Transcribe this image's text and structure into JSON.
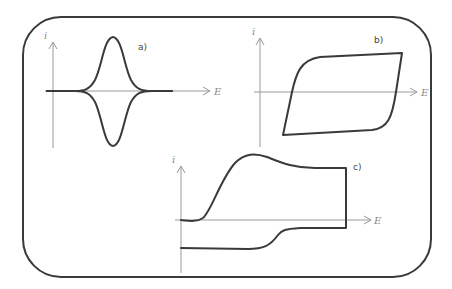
{
  "figure": {
    "colors": {
      "frame": "#3a3a3a",
      "curve": "#3a3a3a",
      "axis": "#9a9a9a",
      "axis_label": "#8a8a8a",
      "background": "#ffffff"
    },
    "panels": [
      {
        "id": "a",
        "label": "a)",
        "y_axis_label": "i",
        "x_axis_label": "E",
        "shape": "symmetric reversible peaks (anodic up, cathodic down)"
      },
      {
        "id": "b",
        "label": "b)",
        "y_axis_label": "i",
        "x_axis_label": "E",
        "shape": "capacitive parallelogram loop"
      },
      {
        "id": "c",
        "label": "c)",
        "y_axis_label": "i",
        "x_axis_label": "E",
        "shape": "irreversible oxidation wave with plateau and reverse sweep"
      }
    ]
  }
}
